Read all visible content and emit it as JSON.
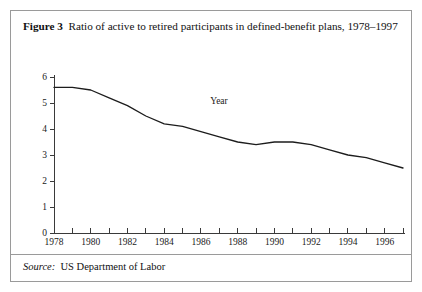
{
  "figure": {
    "label": "Figure 3",
    "caption": "Ratio of active to retired participants in defined-benefit plans, 1978–1997",
    "source_label": "Source:",
    "source_text": "US Department of Labor",
    "border_color": "#9a9a9a"
  },
  "chart_data": {
    "type": "line",
    "title": "Ratio of active to retired participants in defined-benefit plans, 1978–1997",
    "xlabel": "Year",
    "ylabel": "",
    "xlim": [
      1978,
      1997
    ],
    "ylim": [
      0,
      6
    ],
    "grid": false,
    "legend": "none",
    "line_color": "#1c1c1c",
    "x_tick_labels": [
      "1978",
      "1980",
      "1982",
      "1984",
      "1986",
      "1988",
      "1990",
      "1992",
      "1994",
      "1996"
    ],
    "x_tick_values": [
      1978,
      1980,
      1982,
      1984,
      1986,
      1988,
      1990,
      1992,
      1994,
      1996
    ],
    "x_minor_ticks": [
      1979,
      1981,
      1983,
      1985,
      1987,
      1989,
      1991,
      1993,
      1995,
      1997
    ],
    "y_tick_labels": [
      "0",
      "1",
      "2",
      "3",
      "4",
      "5",
      "6"
    ],
    "y_tick_values": [
      0,
      1,
      2,
      3,
      4,
      5,
      6
    ],
    "x": [
      1978,
      1979,
      1980,
      1981,
      1982,
      1983,
      1984,
      1985,
      1986,
      1987,
      1988,
      1989,
      1990,
      1991,
      1992,
      1993,
      1994,
      1995,
      1996,
      1997
    ],
    "values": [
      5.6,
      5.6,
      5.5,
      5.2,
      4.9,
      4.5,
      4.2,
      4.1,
      3.9,
      3.7,
      3.5,
      3.4,
      3.5,
      3.5,
      3.4,
      3.2,
      3.0,
      2.9,
      2.7,
      2.5
    ],
    "series": [
      {
        "name": "Ratio of active to retired participants",
        "values": [
          5.6,
          5.6,
          5.5,
          5.2,
          4.9,
          4.5,
          4.2,
          4.1,
          3.9,
          3.7,
          3.5,
          3.4,
          3.5,
          3.5,
          3.4,
          3.2,
          3.0,
          2.9,
          2.7,
          2.5
        ]
      }
    ]
  }
}
